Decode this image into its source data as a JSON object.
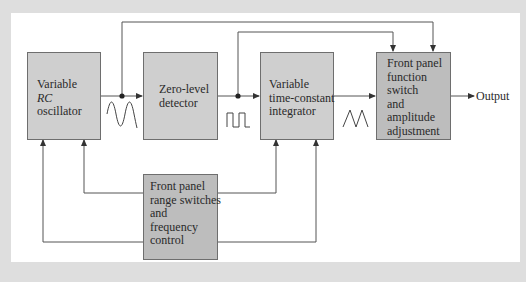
{
  "diagram": {
    "blocks": [
      {
        "id": "rc-oscillator",
        "lines": [
          "Variable",
          "RC",
          "oscillator"
        ],
        "italic_line": 1
      },
      {
        "id": "zero-level-detector",
        "lines": [
          "Zero-level",
          "detector"
        ]
      },
      {
        "id": "integrator",
        "lines": [
          "Variable",
          "time-constant",
          "integrator"
        ]
      },
      {
        "id": "function-switch",
        "lines": [
          "Front panel",
          "function",
          "switch",
          "and",
          "amplitude",
          "adjustment"
        ]
      },
      {
        "id": "range-switches",
        "lines": [
          "Front panel",
          "range switches",
          "and",
          "frequency",
          "control"
        ]
      }
    ],
    "waveforms": [
      {
        "id": "sine-wave",
        "between": [
          "rc-oscillator",
          "zero-level-detector"
        ]
      },
      {
        "id": "square-wave",
        "between": [
          "zero-level-detector",
          "integrator"
        ]
      },
      {
        "id": "triangle-wave",
        "between": [
          "integrator",
          "function-switch"
        ]
      }
    ],
    "output_label": "Output",
    "connections": [
      {
        "from": "rc-oscillator",
        "to": "zero-level-detector"
      },
      {
        "from": "zero-level-detector",
        "to": "integrator"
      },
      {
        "from": "integrator",
        "to": "function-switch"
      },
      {
        "from": "function-switch",
        "to": "output"
      },
      {
        "from": "sine-junction",
        "to": "function-switch"
      },
      {
        "from": "square-junction",
        "to": "function-switch"
      },
      {
        "from": "range-switches",
        "to": "rc-oscillator",
        "count": 2
      },
      {
        "from": "range-switches",
        "to": "integrator",
        "count": 2
      }
    ],
    "colors": {
      "background": "#dedede",
      "panel": "#ffffff",
      "block_fill": "#cfcfcf",
      "block_fill_dark": "#bdbdbd",
      "line": "#555555"
    }
  }
}
